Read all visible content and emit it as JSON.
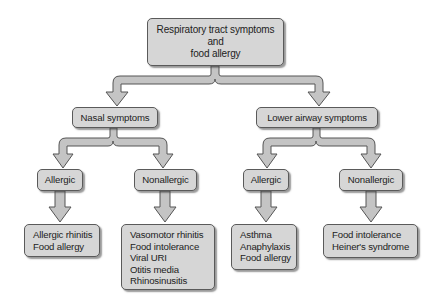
{
  "diagram": {
    "type": "flowchart-tree",
    "colors": {
      "node_fill": "#d6d6d6",
      "node_border": "#5a5a5a",
      "arrow_fill": "#c4c4c4",
      "arrow_stroke": "#555555"
    },
    "root": {
      "lines": [
        "Respiratory tract symptoms",
        "and",
        "food allergy"
      ]
    },
    "level1": {
      "nasal": {
        "label": "Nasal symptoms"
      },
      "lower": {
        "label": "Lower airway symptoms"
      }
    },
    "level2": {
      "nasal_allergic": {
        "label": "Allergic"
      },
      "nasal_nonallergic": {
        "label": "Nonallergic"
      },
      "lower_allergic": {
        "label": "Allergic"
      },
      "lower_nonallergic": {
        "label": "Nonallergic"
      }
    },
    "leaves": {
      "nasal_allergic": {
        "items": [
          "Allergic rhinitis",
          "Food allergy"
        ]
      },
      "nasal_nonallergic": {
        "items": [
          "Vasomotor rhinitis",
          "Food intolerance",
          "Viral URI",
          "Otitis media",
          "Rhinosinusitis"
        ]
      },
      "lower_allergic": {
        "items": [
          "Asthma",
          "Anaphylaxis",
          "Food allergy"
        ]
      },
      "lower_nonallergic": {
        "items": [
          "Food intolerance",
          "Heiner's syndrome"
        ]
      }
    }
  }
}
